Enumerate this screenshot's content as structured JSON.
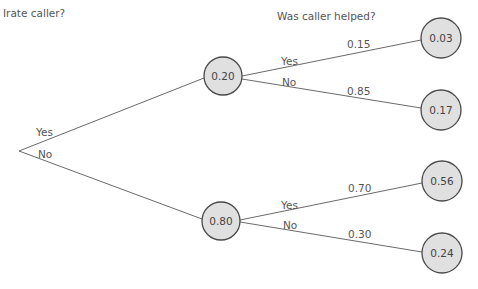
{
  "headers": {
    "level1": "Irate caller?",
    "level2": "Was caller helped?"
  },
  "root": {
    "branches": [
      {
        "label": "Yes"
      },
      {
        "label": "No"
      }
    ]
  },
  "level1_nodes": [
    {
      "value": "0.20",
      "yes_label": "Yes",
      "no_label": "No"
    },
    {
      "value": "0.80",
      "yes_label": "Yes",
      "no_label": "No"
    }
  ],
  "edge_probabilities": [
    {
      "from": "0.20",
      "branch": "Yes",
      "value": "0.15"
    },
    {
      "from": "0.20",
      "branch": "No",
      "value": "0.85"
    },
    {
      "from": "0.80",
      "branch": "Yes",
      "value": "0.70"
    },
    {
      "from": "0.80",
      "branch": "No",
      "value": "0.30"
    }
  ],
  "leaf_nodes": [
    {
      "value": "0.03"
    },
    {
      "value": "0.17"
    },
    {
      "value": "0.56"
    },
    {
      "value": "0.24"
    }
  ],
  "colors": {
    "node_fill": "#e0e0e0",
    "node_stroke": "#4a4a4a",
    "edge": "#6a6a6a",
    "text": "#555555"
  }
}
